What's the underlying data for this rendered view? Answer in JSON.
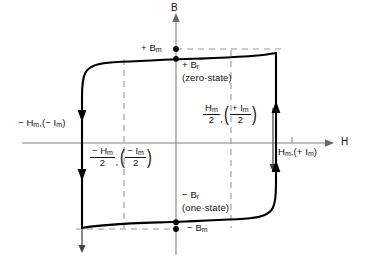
{
  "figure": {
    "type": "hysteresis-loop-diagram",
    "axes": {
      "vertical_label": "B",
      "horizontal_label": "H"
    },
    "colors": {
      "curve": "#000000",
      "axis": "#808080",
      "dashed": "#9a9a9a",
      "solid_guide": "#707070",
      "text": "#111111"
    },
    "labels": {
      "b_max_positive": "+ B",
      "b_max_positive_sub": "m",
      "b_remanent_positive": "+ B",
      "b_remanent_positive_sub": "r",
      "zero_state": "(zero·state)",
      "b_remanent_negative": "− B",
      "b_remanent_negative_sub": "r",
      "one_state": "(one·state)",
      "b_max_negative": "− B",
      "b_max_negative_sub": "m",
      "h_negative_full": "− H",
      "h_negative_full_sub": "m",
      "h_negative_full_current": ",(− I",
      "h_negative_full_current_sub": "m",
      "h_negative_full_close": ")",
      "h_positive_full": "H",
      "h_positive_full_sub": "m",
      "h_positive_full_current": ",(+ I",
      "h_positive_full_current_sub": "m",
      "h_positive_full_close": ")",
      "h_half_negative_num": "− H",
      "h_half_negative_num_sub": "m",
      "h_half_negative_den": "2",
      "h_half_negative_current_num": "− I",
      "h_half_negative_current_num_sub": "m",
      "h_half_negative_current_den": "2",
      "h_half_positive_num": "H",
      "h_half_positive_num_sub": "m",
      "h_half_positive_den": "2",
      "h_half_positive_current_num": "+ I",
      "h_half_positive_current_num_sub": "m",
      "h_half_positive_current_den": "2"
    },
    "geometry": {
      "origin_x": 176,
      "origin_y": 143,
      "h_full_negative_x": 82,
      "h_full_positive_x": 273,
      "h_half_negative_x": 124,
      "h_half_positive_x": 231,
      "b_max_positive_y": 49,
      "b_max_negative_y": 229,
      "b_rem_positive_y": 57,
      "b_rem_negative_y": 224
    }
  }
}
